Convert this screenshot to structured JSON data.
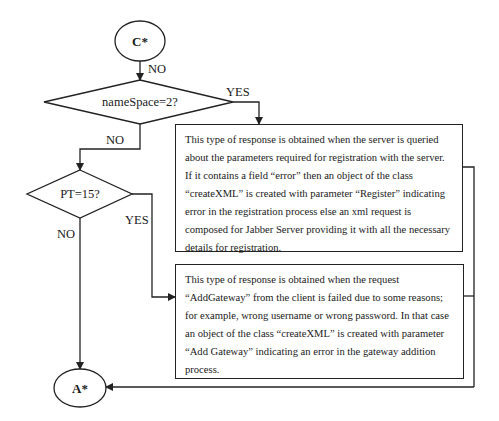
{
  "terminals": {
    "start": "C*",
    "end": "A*"
  },
  "decisions": {
    "d1": "nameSpace=2?",
    "d2": "PT=15?"
  },
  "edge_labels": {
    "start_to_d1": "NO",
    "d1_yes": "YES",
    "d1_no": "NO",
    "d2_yes": "YES",
    "d2_no": "NO"
  },
  "boxes": {
    "register_response": "This type of response is obtained when the server is queried about the parameters required for registration with the server. If it contains a field “error” then an object of the class “createXML” is created with parameter “Register” indicating error in the registration process else an xml request is composed for Jabber Server providing it with all the necessary details for registration.",
    "gateway_response": "This type of response is obtained when the request “AddGateway” from the client is failed due to some reasons; for example, wrong username or wrong password. In that case an object of the class “createXML” is created with parameter “Add Gateway” indicating an error in the gateway addition process."
  }
}
